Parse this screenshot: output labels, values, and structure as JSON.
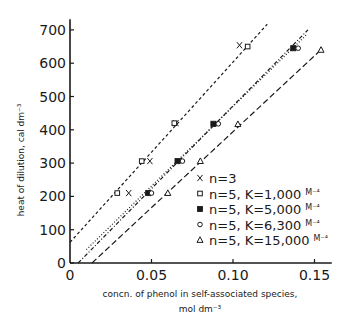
{
  "chart_data": {
    "type": "scatter",
    "title": "",
    "xlabel": "concn. of phenol in self-associated species,",
    "xlabel_unit": "mol dm⁻³",
    "ylabel": "heat of dilution, cal dm⁻³",
    "xlim": [
      0,
      0.16
    ],
    "ylim": [
      0,
      720
    ],
    "x_ticks": [
      0,
      0.05,
      0.1,
      0.15
    ],
    "x_tick_labels": [
      "0",
      "0.05",
      "0.10",
      "0.15"
    ],
    "y_ticks": [
      0,
      100,
      200,
      300,
      400,
      500,
      600,
      700
    ],
    "y_tick_labels": [
      "0",
      "100",
      "200",
      "300",
      "400",
      "500",
      "600",
      "700"
    ],
    "grid": false,
    "legend_position": "center-right",
    "series": [
      {
        "name": "n=3",
        "label_main": "n=3",
        "label_unit": "",
        "marker": "x",
        "x": [
          0.036,
          0.049,
          0.065,
          0.104
        ],
        "y": [
          210,
          306,
          420,
          654
        ]
      },
      {
        "name": "n=5, K=1,000 M⁻⁴",
        "label_main": "n=5, K=1,000",
        "label_unit": "M⁻⁴",
        "marker": "open-square",
        "x": [
          0.029,
          0.044,
          0.064,
          0.109
        ],
        "y": [
          210,
          306,
          420,
          650
        ]
      },
      {
        "name": "n=5, K=5,000 M⁻⁴",
        "label_main": "n=5, K=5,000",
        "label_unit": "M⁻⁴",
        "marker": "filled-square",
        "x": [
          0.048,
          0.066,
          0.088,
          0.137
        ],
        "y": [
          210,
          306,
          418,
          645
        ]
      },
      {
        "name": "n=5, K=6,300 M⁻⁴",
        "label_main": "n=5, K=6,300",
        "label_unit": "M⁻⁴",
        "marker": "open-circle",
        "x": [
          0.05,
          0.069,
          0.091,
          0.14
        ],
        "y": [
          210,
          306,
          418,
          645
        ]
      },
      {
        "name": "n=5, K=15,000 M⁻⁴",
        "label_main": "n=5, K=15,000",
        "label_unit": "M⁻⁴",
        "marker": "open-triangle",
        "x": [
          0.06,
          0.08,
          0.103,
          0.154
        ],
        "y": [
          210,
          306,
          417,
          640
        ]
      }
    ],
    "fit_lines": [
      {
        "name": "fit-n5-K1000",
        "style": "short-dash",
        "x": [
          0.0,
          0.121
        ],
        "y": [
          62,
          717
        ]
      },
      {
        "name": "fit-n5-K5000",
        "style": "dash-dot",
        "x": [
          0.005,
          0.146
        ],
        "y": [
          0,
          700
        ]
      },
      {
        "name": "fit-n5-K6300",
        "style": "dotted",
        "x": [
          0.01,
          0.145
        ],
        "y": [
          40,
          685
        ]
      },
      {
        "name": "fit-n5-K15000",
        "style": "long-dash",
        "x": [
          0.0135,
          0.155
        ],
        "y": [
          0,
          645
        ]
      }
    ]
  }
}
